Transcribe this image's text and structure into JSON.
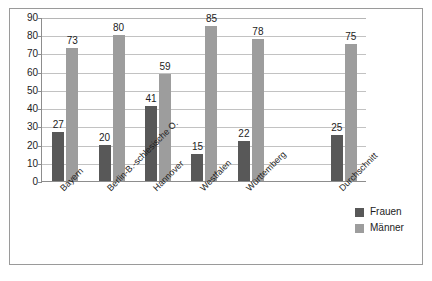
{
  "chart_data": {
    "type": "bar",
    "title": "",
    "subtitle": "",
    "xlabel": "",
    "ylabel": "",
    "ylim": [
      0,
      90
    ],
    "y_ticks": [
      0,
      10,
      20,
      30,
      40,
      50,
      60,
      70,
      80,
      90
    ],
    "grid": true,
    "legend_position": "right-bottom",
    "orientation": "vertical",
    "grouping": "grouped",
    "categories": [
      "Bayern",
      "Berlin-B.-schlesische O.",
      "Hannover",
      "Westfalen",
      "Württemberg",
      "Durchschnitt"
    ],
    "series": [
      {
        "name": "Frauen",
        "color": "#585858",
        "values": [
          27,
          20,
          41,
          15,
          22,
          25
        ]
      },
      {
        "name": "Männer",
        "color": "#9d9d9d",
        "values": [
          73,
          80,
          59,
          85,
          78,
          75
        ]
      }
    ],
    "data_labels": {
      "Frauen": [
        "27",
        "20",
        "41",
        "15",
        "22",
        "25"
      ],
      "Männer": [
        "73",
        "80",
        "59",
        "85",
        "78",
        "75"
      ]
    }
  },
  "legend": {
    "items": [
      {
        "label": "Frauen",
        "color": "#585858"
      },
      {
        "label": "Männer",
        "color": "#9d9d9d"
      }
    ]
  },
  "axis": {
    "y_tick_labels": [
      "90",
      "80",
      "70",
      "60",
      "50",
      "40",
      "30",
      "20",
      "10",
      "0"
    ]
  }
}
